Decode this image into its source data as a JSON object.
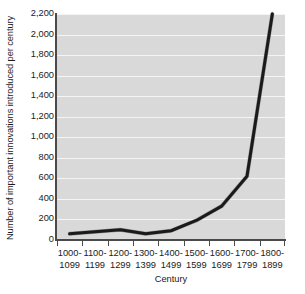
{
  "chart_data": {
    "type": "line",
    "title": "",
    "xlabel": "Century",
    "ylabel": "Number of important innovations introduced per century",
    "categories": [
      "1000-1099",
      "1100-1199",
      "1200-1299",
      "1300-1399",
      "1400-1499",
      "1500-1599",
      "1600-1699",
      "1700-1799",
      "1800-1899"
    ],
    "category_lines": [
      [
        "1000-",
        "1099"
      ],
      [
        "1100-",
        "1199"
      ],
      [
        "1200-",
        "1299"
      ],
      [
        "1300-",
        "1399"
      ],
      [
        "1400-",
        "1499"
      ],
      [
        "1500-",
        "1599"
      ],
      [
        "1600-",
        "1699"
      ],
      [
        "1700-",
        "1799"
      ],
      [
        "1800-",
        "1899"
      ]
    ],
    "values": [
      60,
      80,
      100,
      60,
      90,
      190,
      330,
      620,
      2200
    ],
    "series": [
      {
        "name": "Important innovations",
        "values": [
          60,
          80,
          100,
          60,
          90,
          190,
          330,
          620,
          2200
        ]
      }
    ],
    "ylim": [
      0,
      2200
    ],
    "yticks": [
      0,
      200,
      400,
      600,
      800,
      1000,
      1200,
      1400,
      1600,
      1800,
      2000,
      2200
    ],
    "ytick_labels": [
      "0",
      "200",
      "400",
      "600",
      "800",
      "1,000",
      "1,200",
      "1,400",
      "1,600",
      "1,800",
      "2,000",
      "2,200"
    ],
    "grid": true,
    "legend": "none",
    "colors": {
      "line": "#1a1a1a",
      "line_shadow": "#9a9a9a",
      "plot_background": "#d9d9d9",
      "gridline": "#f4f4f4",
      "axis": "#4a4a4a",
      "text": "#1b1b1b",
      "figure_background": "#ffffff"
    }
  }
}
